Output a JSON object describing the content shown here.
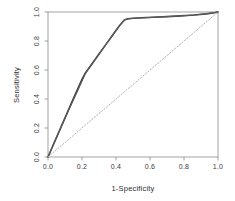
{
  "chart_data": {
    "type": "line",
    "title": "",
    "xlabel": "1-Specificity",
    "ylabel": "Sensitivity",
    "xlim": [
      0.0,
      1.0
    ],
    "ylim": [
      0.0,
      1.0
    ],
    "xticks": [
      "0.0",
      "0.2",
      "0.4",
      "0.6",
      "0.8",
      "1.0"
    ],
    "yticks": [
      "0.0",
      "0.2",
      "0.4",
      "0.6",
      "0.8",
      "1.0"
    ],
    "xtick_values": [
      0.0,
      0.2,
      0.4,
      0.6,
      0.8,
      1.0
    ],
    "ytick_values": [
      0.0,
      0.2,
      0.4,
      0.6,
      0.8,
      1.0
    ],
    "grid": false,
    "legend": "none",
    "series": [
      {
        "name": "ROC curve",
        "style": "solid",
        "color": "#3f3f3f",
        "width": 1.6,
        "x": [
          0.0,
          0.05,
          0.1,
          0.15,
          0.2,
          0.22,
          0.26,
          0.3,
          0.34,
          0.38,
          0.42,
          0.45,
          0.47,
          0.5,
          0.55,
          0.62,
          0.7,
          0.78,
          0.86,
          0.93,
          0.97,
          1.0
        ],
        "y": [
          0.0,
          0.135,
          0.27,
          0.405,
          0.535,
          0.58,
          0.645,
          0.71,
          0.775,
          0.84,
          0.905,
          0.945,
          0.953,
          0.957,
          0.96,
          0.964,
          0.968,
          0.973,
          0.979,
          0.987,
          0.993,
          1.0
        ]
      },
      {
        "name": "ROC curve overlay",
        "style": "solid",
        "color": "#5c5c5c",
        "width": 1.1,
        "x": [
          0.0,
          0.06,
          0.12,
          0.18,
          0.22,
          0.28,
          0.34,
          0.4,
          0.45,
          0.48,
          0.54,
          0.64,
          0.74,
          0.84,
          0.92,
          1.0
        ],
        "y": [
          0.0,
          0.16,
          0.318,
          0.47,
          0.575,
          0.675,
          0.775,
          0.875,
          0.948,
          0.954,
          0.959,
          0.965,
          0.971,
          0.978,
          0.986,
          1.0
        ]
      },
      {
        "name": "reference diagonal",
        "style": "dotted",
        "color": "#a9a9a9",
        "width": 0.9,
        "x": [
          0.0,
          1.0
        ],
        "y": [
          0.0,
          1.0
        ]
      }
    ]
  },
  "plot_box": {
    "left": 48,
    "right": 218,
    "top": 12,
    "bottom": 157,
    "border_color": "#8c8c8c"
  }
}
